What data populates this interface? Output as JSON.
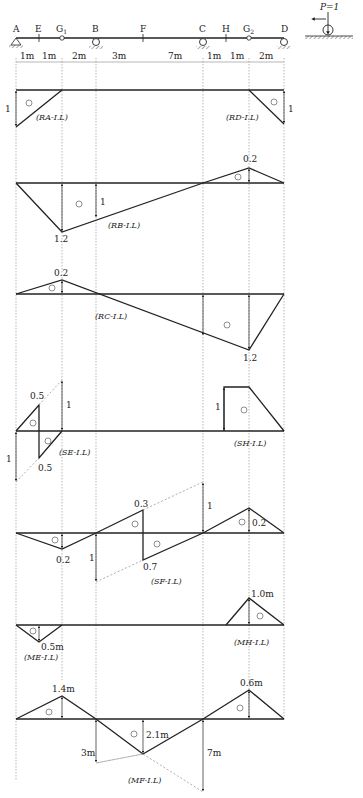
{
  "header_fragment": "",
  "beam": {
    "points": [
      {
        "name": "A",
        "x": 16
      },
      {
        "name": "E",
        "x": 39
      },
      {
        "name": "G1",
        "label": "G₁",
        "x": 62
      },
      {
        "name": "B",
        "x": 96
      },
      {
        "name": "F",
        "x": 143
      },
      {
        "name": "C",
        "x": 203
      },
      {
        "name": "H",
        "x": 226
      },
      {
        "name": "G2",
        "label": "G₂",
        "x": 249
      },
      {
        "name": "D",
        "x": 284
      }
    ],
    "spans": [
      "1m",
      "1m",
      "2m",
      "3m",
      "7m",
      "1m",
      "1m",
      "2m"
    ],
    "supports": [
      "A: pin",
      "B: roller",
      "C: roller",
      "D: roller"
    ],
    "hinges": [
      "G1",
      "G2"
    ],
    "load_legend": "P=1"
  },
  "influence_lines": [
    {
      "id": "RA",
      "label": "(R_A-I.L)",
      "values": {
        "A": "1"
      },
      "sign": "+"
    },
    {
      "id": "RD",
      "label": "(R_D-I.L)",
      "values": {
        "D": "1"
      },
      "sign": "+"
    },
    {
      "id": "RB",
      "label": "(R_B-I.L)",
      "values": {
        "G1": "1.2",
        "B": "1",
        "G2": "0.2"
      },
      "signs": [
        "+",
        "−"
      ]
    },
    {
      "id": "RC",
      "label": "(R_C-I.L)",
      "values": {
        "G1": "0.2",
        "G2": "1.2"
      },
      "signs": [
        "−",
        "+"
      ]
    },
    {
      "id": "SE",
      "label": "(S_E-I.L)",
      "values": {
        "E_left": "0.5",
        "E_right": "0.5",
        "jump": "1",
        "A": "1"
      },
      "signs": [
        "−",
        "+"
      ]
    },
    {
      "id": "SH",
      "label": "(S_H-I.L)",
      "values": {
        "H": "1"
      },
      "sign": "+"
    },
    {
      "id": "SF",
      "label": "(S_F-I.L)",
      "values": {
        "G1": "0.2",
        "F_left": "0.3",
        "F_right": "0.7",
        "B": "1",
        "C": "1",
        "G2": "0.2"
      },
      "signs": [
        "+",
        "−",
        "+",
        "−"
      ]
    },
    {
      "id": "ME",
      "label": "(M_E-I.L)",
      "values": {
        "E": "0.5m"
      },
      "sign": "+"
    },
    {
      "id": "MH",
      "label": "(M_H-I.L)",
      "values": {
        "H": "1.0m"
      },
      "sign": "−"
    },
    {
      "id": "MF",
      "label": "(M_F-I.L)",
      "values": {
        "G1": "1.4m",
        "F": "2.1m",
        "G2": "0.6m",
        "B": "3m",
        "C": "7m"
      },
      "signs": [
        "−",
        "+",
        "−"
      ]
    }
  ],
  "text": {
    "A": "A",
    "E": "E",
    "G1": "G",
    "G1_sub": "1",
    "B": "B",
    "F": "F",
    "C": "C",
    "H": "H",
    "G2": "G",
    "G2_sub": "2",
    "D": "D",
    "s0": "1m",
    "s1": "1m",
    "s2": "2m",
    "s3": "3m",
    "s4": "7m",
    "s5": "1m",
    "s6": "1m",
    "s7": "2m",
    "P": "P=1",
    "RA_lbl": "(RA-I.L)",
    "RD_lbl": "(RD-I.L)",
    "RB_lbl": "(RB-I.L)",
    "RC_lbl": "(RC-I.L)",
    "SE_lbl": "(SE-I.L)",
    "SH_lbl": "(SH-I.L)",
    "SF_lbl": "(SF-I.L)",
    "ME_lbl": "(ME-I.L)",
    "MH_lbl": "(MH-I.L)",
    "MF_lbl": "(MF-I.L)",
    "one": "1",
    "v12": "1.2",
    "v02": "0.2",
    "v05": "0.5",
    "v03": "0.3",
    "v07": "0.7",
    "m05": "0.5m",
    "m10": "1.0m",
    "m14": "1.4m",
    "m21": "2.1m",
    "m06": "0.6m",
    "m3": "3m",
    "m7": "7m",
    "plus": "+",
    "minus": "−"
  }
}
